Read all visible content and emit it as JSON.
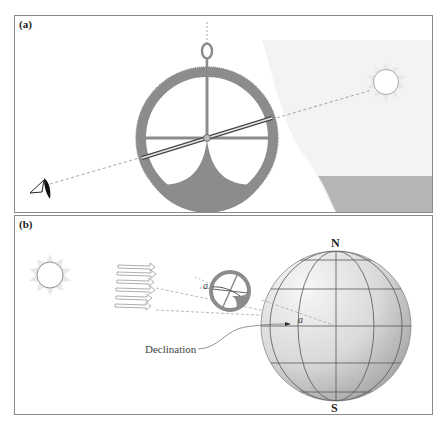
{
  "figure": {
    "panels": [
      {
        "id": "a",
        "label": "(a)",
        "description": "Astrolabe sighting the sun above the horizon",
        "elements": [
          "eye",
          "astrolabe",
          "alidade",
          "sun",
          "sight-line",
          "horizon-sea"
        ]
      },
      {
        "id": "b",
        "label": "(b)",
        "description": "Sun rays striking Earth; small astrolabe measuring angle a",
        "elements": [
          "sun",
          "parallel-rays",
          "small-astrolabe",
          "globe"
        ],
        "annotations": {
          "angle_label_1": "a",
          "angle_label_2": "a",
          "declination_label": "Declination",
          "north_label": "N",
          "south_label": "S"
        }
      }
    ]
  },
  "colors": {
    "border": "#8a8a8a",
    "astrolabe": "#8c8c8c",
    "sun_rays": "#e6e6e6",
    "sun_outline": "#9a9a9a",
    "sea": "#b3b3b3",
    "sky_shade": "#f2f2f2",
    "globe_light": "#f4f4f4",
    "globe_dark": "#a8a8a8",
    "grid_lines": "#555555",
    "dashed": "#9a9a9a"
  }
}
